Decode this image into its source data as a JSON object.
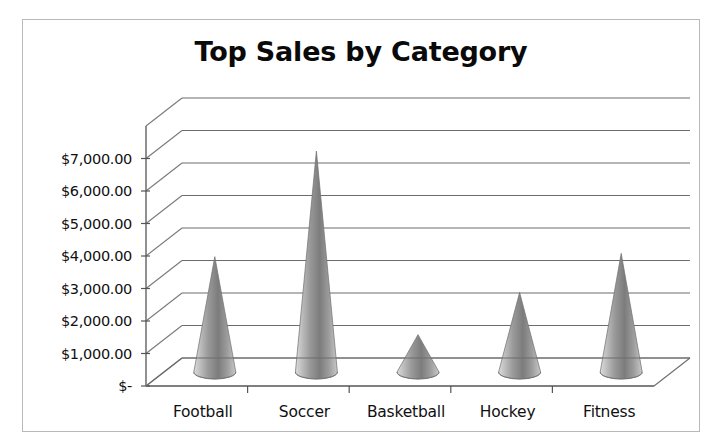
{
  "chart_data": {
    "type": "bar",
    "title": "Top Sales by Category",
    "xlabel": "",
    "ylabel": "",
    "categories": [
      "Football",
      "Soccer",
      "Basketball",
      "Hockey",
      "Fitness"
    ],
    "values": [
      3550,
      6800,
      1150,
      2450,
      3650
    ],
    "ylim": [
      0,
      8000
    ],
    "ytick_values": [
      0,
      1000,
      2000,
      3000,
      4000,
      5000,
      6000,
      7000
    ],
    "ytick_labels": [
      "$-",
      "$1,000.00",
      "$2,000.00",
      "$3,000.00",
      "$4,000.00",
      "$5,000.00",
      "$6,000.00",
      "$7,000.00"
    ],
    "grid": true,
    "legend": null,
    "style": "3d-cone",
    "series_name": "Sales",
    "colors": {
      "cone_light": "#d2d2d2",
      "cone_mid": "#8e8e8e",
      "cone_dark": "#5f5f5f",
      "gridline": "#6d6d6d",
      "axis": "#555555",
      "title": "#0a0a0a",
      "frame_border": "#b9b9b9",
      "background": "#ffffff"
    }
  }
}
